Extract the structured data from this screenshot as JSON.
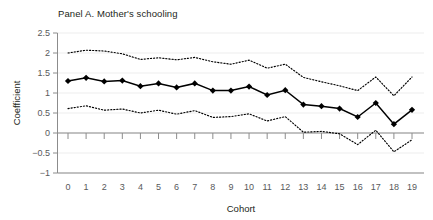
{
  "figure": {
    "panel_title": "Panel A. Mother's schooling"
  },
  "chart_data": {
    "type": "line",
    "title": "Panel A. Mother's schooling",
    "xlabel": "Cohort",
    "ylabel": "Coefficient",
    "xlim": [
      -0.6,
      19.6
    ],
    "ylim": [
      -1,
      2.5
    ],
    "yticks": [
      2.5,
      2,
      1.5,
      1,
      0.5,
      0,
      -0.5,
      -1
    ],
    "ytick_labels": [
      "2.5",
      "2",
      "1.5",
      "1",
      "0.5",
      "0",
      "-0.5",
      "-1"
    ],
    "xticks": [
      0,
      1,
      2,
      3,
      4,
      5,
      6,
      7,
      8,
      9,
      10,
      11,
      12,
      13,
      14,
      15,
      16,
      17,
      18,
      19
    ],
    "xtick_labels": [
      "0",
      "1",
      "2",
      "3",
      "4",
      "5",
      "6",
      "7",
      "8",
      "9",
      "10",
      "11",
      "12",
      "13",
      "14",
      "15",
      "16",
      "17",
      "18",
      "19"
    ],
    "grid": true,
    "grid_axis": "y",
    "legend": null,
    "zero_line": 0,
    "categories": [
      0,
      1,
      2,
      3,
      4,
      5,
      6,
      7,
      8,
      9,
      10,
      11,
      12,
      13,
      14,
      15,
      16,
      17,
      18,
      19
    ],
    "series": [
      {
        "name": "Coefficient",
        "style": "solid-with-diamond-markers",
        "color": "#000000",
        "values": [
          1.3,
          1.38,
          1.29,
          1.31,
          1.17,
          1.24,
          1.14,
          1.24,
          1.06,
          1.06,
          1.16,
          0.95,
          1.07,
          0.71,
          0.67,
          0.61,
          0.4,
          0.75,
          0.22,
          0.58
        ]
      },
      {
        "name": "Upper confidence bound",
        "style": "dotted",
        "color": "#000000",
        "values": [
          2.0,
          2.07,
          2.05,
          1.98,
          1.84,
          1.88,
          1.83,
          1.89,
          1.78,
          1.72,
          1.82,
          1.62,
          1.72,
          1.39,
          1.28,
          1.18,
          1.06,
          1.4,
          0.93,
          1.4
        ]
      },
      {
        "name": "Lower confidence bound",
        "style": "dotted",
        "color": "#000000",
        "values": [
          0.61,
          0.68,
          0.57,
          0.6,
          0.5,
          0.57,
          0.47,
          0.56,
          0.39,
          0.41,
          0.48,
          0.3,
          0.41,
          0.02,
          0.04,
          -0.02,
          -0.29,
          0.07,
          -0.47,
          -0.17
        ]
      }
    ]
  }
}
